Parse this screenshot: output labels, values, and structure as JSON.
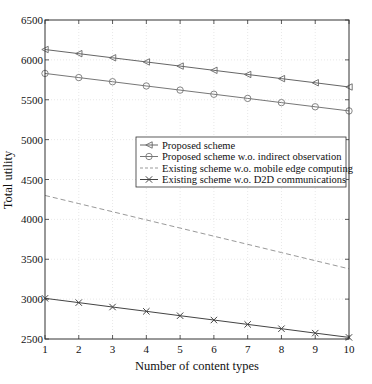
{
  "chart_data": {
    "type": "line",
    "title": "",
    "xlabel": "Number of content types",
    "ylabel": "Total utility",
    "x": [
      1,
      2,
      3,
      4,
      5,
      6,
      7,
      8,
      9,
      10
    ],
    "xlim": [
      1,
      10
    ],
    "ylim": [
      2500,
      6500
    ],
    "xticks": [
      1,
      2,
      3,
      4,
      5,
      6,
      7,
      8,
      9,
      10
    ],
    "yticks": [
      2500,
      3000,
      3500,
      4000,
      4500,
      5000,
      5500,
      6000,
      6500
    ],
    "grid": true,
    "legend_position": "center-right inside",
    "series": [
      {
        "name": "Proposed scheme",
        "marker": "triangle-left",
        "linestyle": "solid",
        "color": "#666666",
        "values": [
          6130,
          6078,
          6026,
          5974,
          5922,
          5869,
          5817,
          5765,
          5713,
          5660
        ]
      },
      {
        "name": "Proposed scheme w.o. indirect observation",
        "marker": "circle",
        "linestyle": "solid",
        "color": "#777777",
        "values": [
          5830,
          5778,
          5726,
          5673,
          5621,
          5569,
          5517,
          5464,
          5412,
          5360
        ]
      },
      {
        "name": "Existing scheme w.o. mobile edge computing",
        "marker": "none",
        "linestyle": "dashed",
        "color": "#999999",
        "values": [
          4300,
          4198,
          4096,
          3993,
          3891,
          3789,
          3687,
          3584,
          3482,
          3380
        ]
      },
      {
        "name": "Existing scheme w.o. D2D communications",
        "marker": "x",
        "linestyle": "solid",
        "color": "#444444",
        "values": [
          3010,
          2956,
          2901,
          2847,
          2792,
          2738,
          2683,
          2629,
          2574,
          2520
        ]
      }
    ]
  }
}
